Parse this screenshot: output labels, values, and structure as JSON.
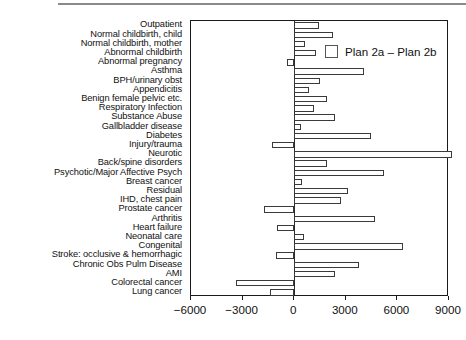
{
  "chart_data": {
    "type": "bar",
    "orientation": "horizontal",
    "title": "",
    "subtitle": "",
    "xlabel": "",
    "ylabel": "",
    "xlim": [
      -6000,
      9000
    ],
    "xticks": [
      -6000,
      -3000,
      0,
      3000,
      6000,
      9000
    ],
    "xticklabels": [
      "−6000",
      "−3000",
      "0",
      "3000",
      "6000",
      "9000"
    ],
    "grid": false,
    "legend_position": "top-right",
    "legend": [
      "Plan 2a – Plan 2b"
    ],
    "series_name": "Plan 2a – Plan 2b",
    "bar_facecolor": "#ffffff",
    "bar_edgecolor": "#3a3a3a",
    "categories": [
      "Outpatient",
      "Normal childbirth, child",
      "Normal childbirth, mother",
      "Abnormal childbirth",
      "Abnormal pregnancy",
      "Asthma",
      "BPH/urinary obst",
      "Appendicitis",
      "Benign female pelvic etc.",
      "Respiratory Infection",
      "Substance Abuse",
      "Gallbladder disease",
      "Diabetes",
      "Injury/trauma",
      "Neurotic",
      "Back/spine disorders",
      "Psychotic/Major Affective Psych",
      "Breast cancer",
      "Residual",
      "IHD, chest pain",
      "Prostate cancer",
      "Arthritis",
      "Heart failure",
      "Neonatal care",
      "Congenital",
      "Stroke: occlusive & hemorrhagic",
      "Chronic Obs Pulm Disease",
      "AMI",
      "Colorectal cancer",
      "Lung cancer"
    ],
    "values": [
      1450,
      2250,
      600,
      1250,
      -400,
      4050,
      1500,
      850,
      1900,
      1150,
      2400,
      400,
      4450,
      -1300,
      9150,
      1900,
      5250,
      450,
      3100,
      2750,
      -1750,
      4700,
      -1000,
      550,
      6350,
      -1050,
      3750,
      2400,
      -3400,
      -1400
    ]
  }
}
